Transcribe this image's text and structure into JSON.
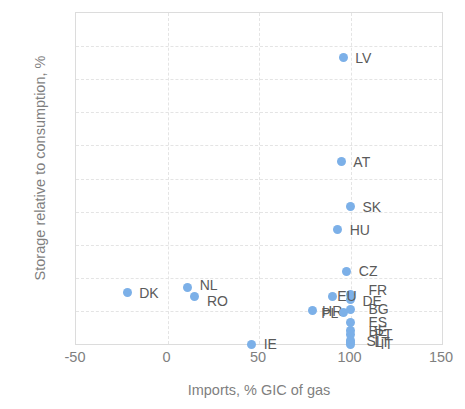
{
  "chart_data": {
    "type": "scatter",
    "title": "",
    "xlabel": "Imports, % GIC of gas",
    "ylabel": "Storage relative to consumption, %",
    "xlim": [
      -50,
      150
    ],
    "ylim": [
      0,
      200
    ],
    "xticks": [
      -50,
      0,
      50,
      100,
      150
    ],
    "yticks": [
      0,
      20,
      40,
      60,
      80,
      100,
      120,
      140,
      160,
      180,
      200
    ],
    "grid": true,
    "legend": "none",
    "marker_color": "#7cb0e8",
    "points": [
      {
        "label": "LV",
        "x": 96,
        "y": 173,
        "lx": 12,
        "ly": 0
      },
      {
        "label": "AT",
        "x": 95,
        "y": 110,
        "lx": 12,
        "ly": 0
      },
      {
        "label": "SK",
        "x": 100,
        "y": 83,
        "lx": 12,
        "ly": 0
      },
      {
        "label": "HU",
        "x": 93,
        "y": 69,
        "lx": 12,
        "ly": 0
      },
      {
        "label": "CZ",
        "x": 98,
        "y": 44,
        "lx": 12,
        "ly": 0
      },
      {
        "label": "NL",
        "x": 11,
        "y": 34,
        "lx": 12,
        "ly": -3
      },
      {
        "label": "DK",
        "x": -22,
        "y": 31,
        "lx": 12,
        "ly": 0
      },
      {
        "label": "RO",
        "x": 15,
        "y": 29,
        "lx": 12,
        "ly": 5
      },
      {
        "label": "FR",
        "x": 100,
        "y": 30,
        "lx": 18,
        "ly": -4
      },
      {
        "label": "DE",
        "x": 100,
        "y": 27,
        "lx": 12,
        "ly": 2
      },
      {
        "label": "EU",
        "x": 90,
        "y": 29,
        "lx": 5,
        "ly": 0
      },
      {
        "label": "BG",
        "x": 100,
        "y": 21,
        "lx": 18,
        "ly": 0
      },
      {
        "label": "HR",
        "x": 79,
        "y": 20,
        "lx": 10,
        "ly": 0
      },
      {
        "label": "PL",
        "x": 96,
        "y": 19,
        "lx": -22,
        "ly": 0
      },
      {
        "label": "ES",
        "x": 100,
        "y": 13,
        "lx": 18,
        "ly": 0
      },
      {
        "label": "BE",
        "x": 100,
        "y": 8,
        "lx": 18,
        "ly": 0
      },
      {
        "label": "PT",
        "x": 100,
        "y": 6,
        "lx": 24,
        "ly": 0
      },
      {
        "label": "SI",
        "x": 100,
        "y": 2,
        "lx": 16,
        "ly": 0
      },
      {
        "label": "LT",
        "x": 100,
        "y": 1,
        "lx": 24,
        "ly": 0
      },
      {
        "label": "IT",
        "x": 100,
        "y": 0,
        "lx": 30,
        "ly": 0
      },
      {
        "label": "IE",
        "x": 46,
        "y": 0,
        "lx": 12,
        "ly": 0
      }
    ]
  }
}
